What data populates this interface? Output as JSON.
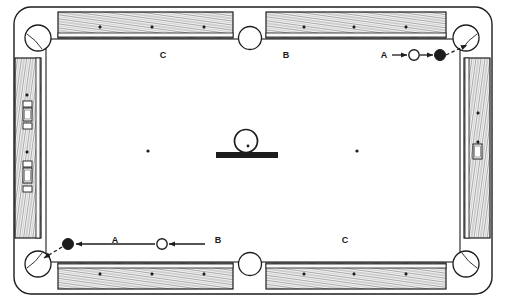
{
  "figure": {
    "kind": "billiard-table-diagram",
    "title": "",
    "width": 506,
    "height": 301,
    "background": "#ffffff",
    "ink": "#1d1d1d",
    "rail_fill": "#f2f2f2",
    "cloth_fill": "#ffffff"
  },
  "table": {
    "outer": {
      "x": 14,
      "y": 7,
      "width": 478,
      "height": 287,
      "corner_radius": 17
    },
    "cushion_line": {
      "x": 46,
      "y": 39,
      "width": 414,
      "height": 223
    },
    "rail_band": 26
  },
  "labels": {
    "top_left": "C",
    "top_right": "B",
    "top_shot": "A",
    "bottom_left_shot": "A",
    "bottom_mid": "B",
    "bottom_right": "C"
  },
  "label_positions": {
    "top_left": {
      "x": 163,
      "y": 58
    },
    "top_right": {
      "x": 286,
      "y": 58
    },
    "top_shot": {
      "x": 384,
      "y": 58
    },
    "bottom_left_shot": {
      "x": 115,
      "y": 243
    },
    "bottom_mid": {
      "x": 218,
      "y": 243
    },
    "bottom_right": {
      "x": 345,
      "y": 243
    }
  },
  "pockets": {
    "radius_corner": 13,
    "radius_side": 11.5,
    "list": [
      {
        "name": "pocket-top-left",
        "cx": 38,
        "cy": 38,
        "type": "corner"
      },
      {
        "name": "pocket-top-middle",
        "cx": 250,
        "cy": 38,
        "type": "side"
      },
      {
        "name": "pocket-top-right",
        "cx": 466,
        "cy": 38,
        "type": "corner"
      },
      {
        "name": "pocket-bottom-left",
        "cx": 38,
        "cy": 264,
        "type": "corner"
      },
      {
        "name": "pocket-bottom-middle",
        "cx": 250,
        "cy": 264,
        "type": "side"
      },
      {
        "name": "pocket-bottom-right",
        "cx": 466,
        "cy": 264,
        "type": "corner"
      }
    ]
  },
  "rail_segments": [
    {
      "name": "rail-top-left",
      "x": 58,
      "y": 12,
      "width": 175,
      "height": 26,
      "orient": "h"
    },
    {
      "name": "rail-top-right",
      "x": 266,
      "y": 12,
      "width": 180,
      "height": 26,
      "orient": "h"
    },
    {
      "name": "rail-bottom-left",
      "x": 58,
      "y": 263,
      "width": 175,
      "height": 26,
      "orient": "h"
    },
    {
      "name": "rail-bottom-right",
      "x": 266,
      "y": 263,
      "width": 180,
      "height": 26,
      "orient": "h"
    },
    {
      "name": "rail-left",
      "x": 15,
      "y": 58,
      "width": 26,
      "height": 180,
      "orient": "v"
    },
    {
      "name": "rail-right",
      "x": 464,
      "y": 58,
      "width": 26,
      "height": 180,
      "orient": "v"
    }
  ],
  "rail_diamonds": {
    "top_left": [
      {
        "x": 100,
        "y": 27
      },
      {
        "x": 152,
        "y": 27
      },
      {
        "x": 204,
        "y": 27
      }
    ],
    "top_right": [
      {
        "x": 304,
        "y": 27
      },
      {
        "x": 354,
        "y": 27
      },
      {
        "x": 406,
        "y": 27
      }
    ],
    "bottom_left": [
      {
        "x": 100,
        "y": 274
      },
      {
        "x": 152,
        "y": 274
      },
      {
        "x": 204,
        "y": 274
      }
    ],
    "bottom_right": [
      {
        "x": 304,
        "y": 274
      },
      {
        "x": 354,
        "y": 274
      },
      {
        "x": 406,
        "y": 274
      }
    ],
    "left": [
      {
        "x": 27,
        "y": 95
      },
      {
        "x": 27,
        "y": 152
      }
    ],
    "right": [
      {
        "x": 478,
        "y": 113
      },
      {
        "x": 478,
        "y": 142
      }
    ]
  },
  "rail_clamps": [
    {
      "name": "clamp-left-upper",
      "x": 23,
      "y": 108,
      "width": 9,
      "height": 13
    },
    {
      "name": "clamp-left-lower",
      "x": 23,
      "y": 168,
      "width": 9,
      "height": 15
    },
    {
      "name": "clamp-right",
      "x": 473,
      "y": 144,
      "width": 9,
      "height": 15
    }
  ],
  "table_spots": [
    {
      "name": "spot-left",
      "x": 148,
      "y": 151
    },
    {
      "name": "spot-right",
      "x": 357,
      "y": 151
    }
  ],
  "center_object": {
    "name": "cue-ball-on-bridge",
    "ball": {
      "cx": 246,
      "cy": 141,
      "r": 11.5
    },
    "ball_dot": {
      "cx": 248,
      "cy": 146,
      "r": 1.4
    },
    "bar": {
      "x": 216,
      "y": 152,
      "width": 62,
      "height": 6
    }
  },
  "shots": [
    {
      "name": "shot-top-right",
      "label": "A",
      "direction": "right",
      "cue_ball": {
        "cx": 414,
        "cy": 55,
        "r": 5.2,
        "fill": "#ffffff"
      },
      "object_ball": {
        "cx": 440,
        "cy": 55,
        "r": 5.5,
        "fill": "#1d1d1d"
      },
      "segments": [
        {
          "kind": "solid",
          "x1": 392,
          "y1": 55,
          "x2": 407,
          "y2": 55
        },
        {
          "kind": "solid",
          "x1": 420,
          "y1": 55,
          "x2": 433,
          "y2": 55
        },
        {
          "kind": "dashed",
          "x1": 446,
          "y1": 55,
          "x2": 467,
          "y2": 45
        }
      ]
    },
    {
      "name": "shot-bottom-left",
      "label": "A",
      "direction": "left",
      "cue_ball": {
        "cx": 162,
        "cy": 244,
        "r": 5.2,
        "fill": "#ffffff"
      },
      "object_ball": {
        "cx": 68,
        "cy": 244,
        "r": 5.5,
        "fill": "#1d1d1d"
      },
      "segments": [
        {
          "kind": "solid",
          "x1": 205,
          "y1": 244,
          "x2": 169,
          "y2": 244
        },
        {
          "kind": "solid",
          "x1": 155,
          "y1": 244,
          "x2": 76,
          "y2": 244
        },
        {
          "kind": "dashed",
          "x1": 62,
          "y1": 247,
          "x2": 44,
          "y2": 258
        }
      ]
    }
  ]
}
